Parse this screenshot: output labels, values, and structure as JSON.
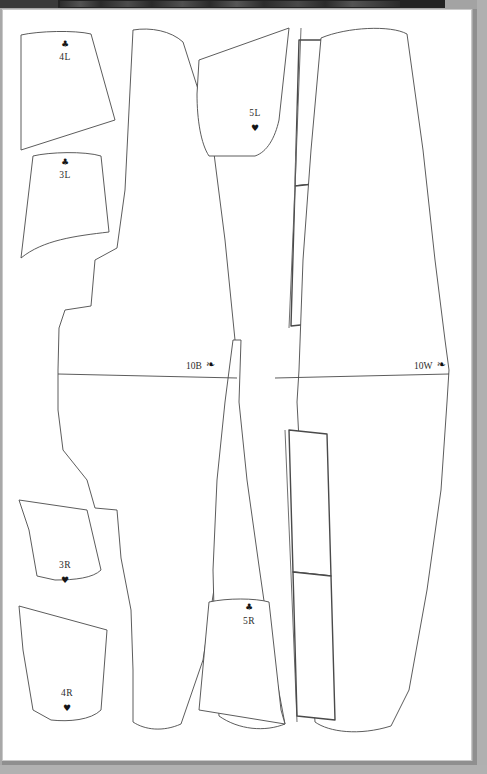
{
  "viewer": {
    "background_color": "#a8a8a8",
    "toolbar": {
      "name": "document-viewer-toolbar",
      "color": "#232323",
      "label": ""
    }
  },
  "document": {
    "type": "sewing-pattern-sheet",
    "page_color": "#ffffff",
    "line_color": "#4a4a4a"
  },
  "pieces": [
    {
      "id": "4L",
      "label": "4L",
      "symbol": "♣",
      "symbol_name": "club-icon",
      "symbol_position": "above"
    },
    {
      "id": "3L",
      "label": "3L",
      "symbol": "♣",
      "symbol_name": "club-icon",
      "symbol_position": "above"
    },
    {
      "id": "5L",
      "label": "5L",
      "symbol": "♥",
      "symbol_name": "heart-icon",
      "symbol_position": "below"
    },
    {
      "id": "10B",
      "label": "10B",
      "symbol": "❧",
      "symbol_name": "arrow-marker-icon",
      "symbol_position": "right"
    },
    {
      "id": "10W",
      "label": "10W",
      "symbol": "❧",
      "symbol_name": "arrow-marker-icon",
      "symbol_position": "right"
    },
    {
      "id": "3R",
      "label": "3R",
      "symbol": "♥",
      "symbol_name": "heart-icon",
      "symbol_position": "below"
    },
    {
      "id": "4R",
      "label": "4R",
      "symbol": "♥",
      "symbol_name": "heart-icon",
      "symbol_position": "below"
    },
    {
      "id": "5R",
      "label": "5R",
      "symbol": "♣",
      "symbol_name": "club-icon",
      "symbol_position": "above"
    }
  ]
}
